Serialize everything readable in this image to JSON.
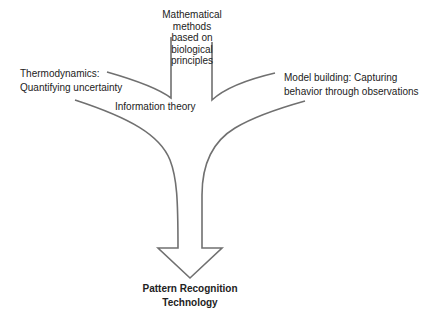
{
  "diagram": {
    "type": "converging-flow",
    "stroke_color": "#707070",
    "text_color": "#222222",
    "background": "#ffffff",
    "sources": {
      "left": {
        "lines": [
          "Thermodynamics:",
          "Quantifying uncertainty"
        ]
      },
      "center_top": {
        "lines": [
          "Mathematical",
          "methods",
          "based on",
          "biological",
          "principles"
        ]
      },
      "center_junction": {
        "lines": [
          "Information theory"
        ]
      },
      "right": {
        "lines": [
          "Model building: Capturing",
          "behavior through observations"
        ]
      }
    },
    "target": {
      "lines": [
        "Pattern Recognition",
        "Technology"
      ]
    }
  }
}
